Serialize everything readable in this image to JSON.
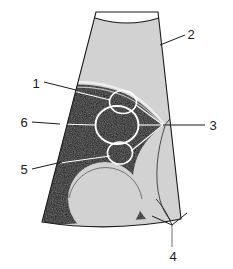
{
  "figure": {
    "background_color": "#ffffff",
    "outline_color": "#1a1a1a",
    "tissue_gray_color": "#d2d2d2",
    "hypoechoic_dark_color": "#0d0d0d",
    "near_field_color": "#ffffff",
    "highlight_line_color": "#f2f2f2"
  },
  "callouts": [
    {
      "id": "callout-1",
      "label": "1",
      "label_x": 36,
      "label_y": 83,
      "description": "curved interface line at upper margin of dark region"
    },
    {
      "id": "callout-2",
      "label": "2",
      "label_x": 190,
      "label_y": 38,
      "description": "gray sector tissue field at upper right"
    },
    {
      "id": "callout-3",
      "label": "3",
      "label_x": 212,
      "label_y": 129,
      "description": "convergence point at right of dark region"
    },
    {
      "id": "callout-4",
      "label": "4",
      "label_x": 173,
      "label_y": 256,
      "description": "forked marker at lower boundary arc"
    },
    {
      "id": "callout-5",
      "label": "5",
      "label_x": 23,
      "label_y": 173,
      "description": "lower small circular structure"
    },
    {
      "id": "callout-6",
      "label": "6",
      "label_x": 23,
      "label_y": 126,
      "description": "central large circular structure"
    }
  ],
  "structures": {
    "circle_top": {
      "cx": 123,
      "cy": 102,
      "rx": 13,
      "ry": 11
    },
    "circle_center": {
      "cx": 117,
      "cy": 125,
      "rx": 21,
      "ry": 19
    },
    "circle_bottom": {
      "cx": 120,
      "cy": 153,
      "rx": 12,
      "ry": 11
    },
    "lobe_lower_left": {
      "cx": 105,
      "cy": 199,
      "r": 36
    },
    "lobe_lower_right": {
      "cx": 185,
      "cy": 165,
      "r": 45
    }
  }
}
